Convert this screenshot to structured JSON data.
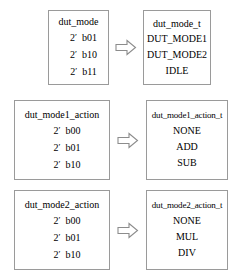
{
  "diagram": {
    "arrow_icon": "block-arrow-right-icon",
    "rows": [
      {
        "source": {
          "title": "dut_mode",
          "values": [
            {
              "width": "2",
              "prime": "′",
              "bits": "b01"
            },
            {
              "width": "2",
              "prime": "′",
              "bits": "b10"
            },
            {
              "width": "2",
              "prime": "′",
              "bits": "b11"
            }
          ]
        },
        "target": {
          "title": "dut_mode_t",
          "values": [
            "DUT_MODE1",
            "DUT_MODE2",
            "IDLE"
          ]
        }
      },
      {
        "source": {
          "title": "dut_mode1_action",
          "values": [
            {
              "width": "2",
              "prime": "′",
              "bits": "b00"
            },
            {
              "width": "2",
              "prime": "′",
              "bits": "b01"
            },
            {
              "width": "2",
              "prime": "′",
              "bits": "b10"
            }
          ]
        },
        "target": {
          "title": "dut_mode1_action_t",
          "values": [
            "NONE",
            "ADD",
            "SUB"
          ]
        }
      },
      {
        "source": {
          "title": "dut_mode2_action",
          "values": [
            {
              "width": "2",
              "prime": "′",
              "bits": "b00"
            },
            {
              "width": "2",
              "prime": "′",
              "bits": "b01"
            },
            {
              "width": "2",
              "prime": "′",
              "bits": "b10"
            }
          ]
        },
        "target": {
          "title": "dut_mode2_action_t",
          "values": [
            "NONE",
            "MUL",
            "DIV"
          ]
        }
      }
    ]
  },
  "colors": {
    "background": "#ffffff",
    "border": "#9a9a9a",
    "text": "#000000",
    "arrow_stroke": "#8c8c8c"
  }
}
